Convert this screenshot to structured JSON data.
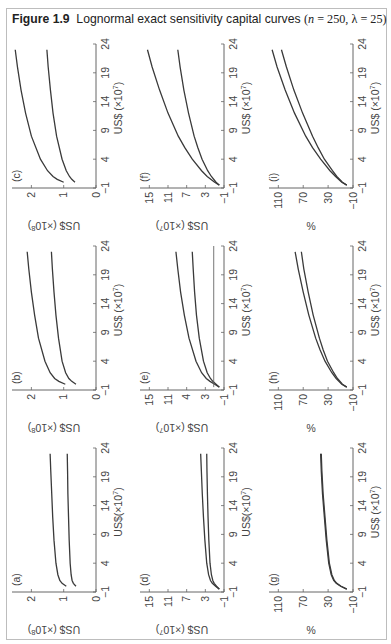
{
  "figure": {
    "label": "Figure 1.9",
    "title_text": "Lognormal exact sensitivity capital curves",
    "params_open": "(",
    "param_n_sym": "n",
    "param_n_val": " = 250, ",
    "param_lambda_sym": "λ",
    "param_lambda_val": " = 25)"
  },
  "colors": {
    "frame": "#bdbdbd",
    "axis": "#666666",
    "curve": "#3a3a3a",
    "text": "#444444"
  },
  "chart_data": [
    {
      "id": "a",
      "type": "line",
      "panel_label": "(a)",
      "xlabel": "US$(×10^7)",
      "ylabel": "US$ (×10^8)",
      "xticks": [
        "-1",
        "4",
        "9",
        "14",
        "19",
        "24"
      ],
      "yticks": [
        "0",
        "1",
        "2"
      ],
      "xlim": [
        -1,
        24
      ],
      "ylim": [
        0,
        2.6
      ],
      "x": [
        0,
        0.5,
        1,
        2,
        4,
        8,
        12,
        16,
        20,
        23
      ],
      "series": [
        {
          "name": "upper",
          "values": [
            0.92,
            1.05,
            1.12,
            1.18,
            1.24,
            1.3,
            1.34,
            1.37,
            1.4,
            1.42
          ]
        },
        {
          "name": "lower",
          "values": [
            0.62,
            0.7,
            0.74,
            0.77,
            0.8,
            0.83,
            0.85,
            0.87,
            0.88,
            0.89
          ]
        }
      ]
    },
    {
      "id": "b",
      "type": "line",
      "panel_label": "(b)",
      "xlabel": "US$ (×10^7)",
      "ylabel": "US$ (×10^8)",
      "xticks": [
        "-1",
        "4",
        "9",
        "14",
        "19",
        "24"
      ],
      "yticks": [
        "0",
        "1",
        "2"
      ],
      "xlim": [
        -1,
        24
      ],
      "ylim": [
        0,
        2.6
      ],
      "x": [
        0,
        0.5,
        1,
        2,
        4,
        8,
        12,
        16,
        20,
        23
      ],
      "series": [
        {
          "name": "upper",
          "values": [
            0.95,
            1.15,
            1.28,
            1.42,
            1.58,
            1.78,
            1.9,
            2.0,
            2.08,
            2.13
          ]
        },
        {
          "name": "lower",
          "values": [
            0.62,
            0.75,
            0.84,
            0.94,
            1.05,
            1.16,
            1.24,
            1.3,
            1.35,
            1.38
          ]
        }
      ]
    },
    {
      "id": "c",
      "type": "line",
      "panel_label": "(c)",
      "xlabel": "US$ (×10^7)",
      "ylabel": "US$ (×10^8)",
      "xticks": [
        "-1",
        "4",
        "9",
        "14",
        "19",
        "24"
      ],
      "yticks": [
        "0",
        "1",
        "2"
      ],
      "xlim": [
        -1,
        24
      ],
      "ylim": [
        0,
        2.6
      ],
      "x": [
        0,
        0.5,
        1,
        2,
        4,
        8,
        12,
        16,
        20,
        23
      ],
      "series": [
        {
          "name": "upper",
          "values": [
            1.0,
            1.2,
            1.33,
            1.5,
            1.72,
            2.0,
            2.18,
            2.32,
            2.43,
            2.5
          ]
        },
        {
          "name": "lower",
          "values": [
            0.65,
            0.75,
            0.82,
            0.92,
            1.05,
            1.22,
            1.33,
            1.41,
            1.48,
            1.52
          ]
        }
      ]
    },
    {
      "id": "d",
      "type": "line",
      "panel_label": "(d)",
      "xlabel": "US$(×10^7)",
      "ylabel": "US$ (×10^7)",
      "xticks": [
        "-1",
        "4",
        "9",
        "14",
        "19",
        "24"
      ],
      "yticks": [
        "-1",
        "3",
        "7",
        "11",
        "15"
      ],
      "xlim": [
        -1,
        24
      ],
      "ylim": [
        -1,
        17
      ],
      "x": [
        -0.5,
        0,
        0.5,
        1,
        2,
        4,
        8,
        12,
        16,
        20,
        23
      ],
      "series": [
        {
          "name": "upper",
          "values": [
            0.0,
            0.8,
            1.5,
            1.9,
            2.3,
            2.7,
            3.1,
            3.4,
            3.65,
            3.85,
            4.0
          ]
        },
        {
          "name": "lower",
          "values": [
            0.0,
            0.6,
            1.1,
            1.4,
            1.7,
            2.0,
            2.25,
            2.42,
            2.55,
            2.65,
            2.7
          ]
        }
      ]
    },
    {
      "id": "e",
      "type": "line",
      "panel_label": "(e)",
      "xlabel": "US$ (×10^7)",
      "ylabel": "US$ (×10^7)",
      "xticks": [
        "-1",
        "4",
        "9",
        "14",
        "19",
        "24"
      ],
      "yticks": [
        "-1",
        "3",
        "4",
        "11",
        "15"
      ],
      "xlim": [
        -1,
        24
      ],
      "ylim": [
        -1,
        17
      ],
      "x": [
        -0.5,
        0,
        0.5,
        1,
        2,
        4,
        8,
        12,
        16,
        20,
        23
      ],
      "series": [
        {
          "name": "upper",
          "values": [
            0.0,
            1.0,
            2.0,
            2.8,
            3.8,
            5.0,
            6.5,
            7.5,
            8.3,
            8.9,
            9.3
          ]
        },
        {
          "name": "lower",
          "values": [
            0.0,
            0.7,
            1.4,
            1.9,
            2.6,
            3.4,
            4.3,
            4.9,
            5.3,
            5.6,
            5.8
          ]
        },
        {
          "name": "baseline",
          "values": [
            1.2,
            1.2,
            1.2,
            1.2,
            1.2,
            1.2,
            1.2,
            1.2,
            1.2,
            1.2,
            1.2
          ]
        }
      ]
    },
    {
      "id": "f",
      "type": "line",
      "panel_label": "(f)",
      "xlabel": "US$ (×10^7)",
      "ylabel": "US$ (×10^7)",
      "xticks": [
        "-1",
        "4",
        "9",
        "14",
        "19",
        "24"
      ],
      "yticks": [
        "-1",
        "3",
        "7",
        "11",
        "15"
      ],
      "xlim": [
        -1,
        24
      ],
      "ylim": [
        -1,
        17
      ],
      "x": [
        -0.5,
        0,
        1,
        2,
        4,
        6,
        8,
        12,
        16,
        20,
        23
      ],
      "series": [
        {
          "name": "upper",
          "values": [
            0.0,
            1.0,
            2.6,
            3.8,
            5.8,
            7.4,
            8.8,
            11.0,
            12.8,
            14.4,
            15.4
          ]
        },
        {
          "name": "lower",
          "values": [
            0.0,
            0.7,
            1.7,
            2.5,
            3.7,
            4.6,
            5.4,
            6.6,
            7.6,
            8.4,
            8.9
          ]
        }
      ]
    },
    {
      "id": "g",
      "type": "line",
      "panel_label": "(g)",
      "xlabel": "US$ (×10^7)",
      "ylabel": "%",
      "xticks": [
        "-1",
        "4",
        "9",
        "14",
        "19",
        "24"
      ],
      "yticks": [
        "-10",
        "30",
        "70",
        "110"
      ],
      "xlim": [
        -1,
        24
      ],
      "ylim": [
        -10,
        125
      ],
      "x": [
        -0.5,
        0,
        0.5,
        1,
        2,
        4,
        8,
        12,
        16,
        20,
        23
      ],
      "series": [
        {
          "name": "upper",
          "values": [
            0,
            10,
            17,
            21,
            25,
            29,
            33,
            36,
            39,
            41,
            42
          ]
        },
        {
          "name": "lower",
          "values": [
            0,
            9,
            16,
            20,
            24,
            28,
            32,
            35,
            38,
            40,
            41
          ]
        }
      ]
    },
    {
      "id": "h",
      "type": "line",
      "panel_label": "(h)",
      "xlabel": "US$ (×10^7)",
      "ylabel": "%",
      "xticks": [
        "-1",
        "4",
        "9",
        "14",
        "19",
        "24"
      ],
      "yticks": [
        "-10",
        "30",
        "70",
        "110"
      ],
      "xlim": [
        -1,
        24
      ],
      "ylim": [
        -10,
        125
      ],
      "x": [
        -0.5,
        0,
        1,
        2,
        4,
        6,
        8,
        12,
        16,
        20,
        23
      ],
      "series": [
        {
          "name": "upper",
          "values": [
            0,
            8,
            17,
            24,
            35,
            43,
            50,
            61,
            70,
            78,
            83
          ]
        },
        {
          "name": "lower",
          "values": [
            0,
            7,
            15,
            21,
            31,
            38,
            44,
            54,
            62,
            69,
            73
          ]
        }
      ]
    },
    {
      "id": "i",
      "type": "line",
      "panel_label": "(i)",
      "xlabel": "US$ (×10^7)",
      "ylabel": "%",
      "xticks": [
        "-1",
        "4",
        "9",
        "14",
        "19",
        "24"
      ],
      "yticks": [
        "-10",
        "30",
        "70",
        "110"
      ],
      "xlim": [
        -1,
        24
      ],
      "ylim": [
        -10,
        125
      ],
      "x": [
        -0.5,
        0,
        1,
        2,
        4,
        6,
        8,
        12,
        16,
        20,
        23
      ],
      "series": [
        {
          "name": "upper",
          "values": [
            0,
            8,
            18,
            27,
            42,
            55,
            66,
            84,
            99,
            112,
            120
          ]
        },
        {
          "name": "lower",
          "values": [
            0,
            7,
            16,
            23,
            36,
            46,
            55,
            71,
            85,
            97,
            105
          ]
        }
      ]
    }
  ]
}
